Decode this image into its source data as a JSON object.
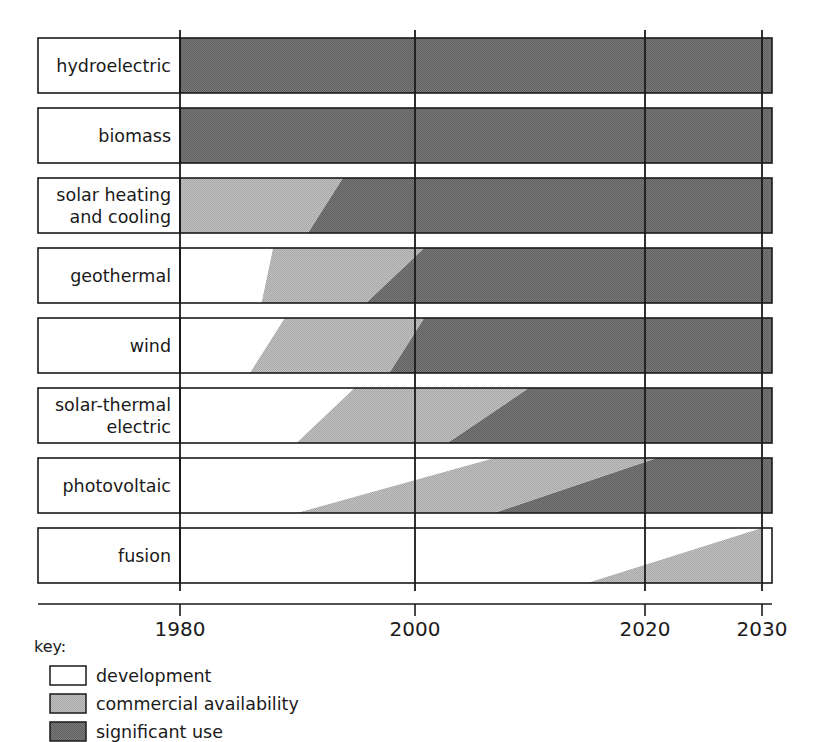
{
  "chart_data": {
    "type": "bar",
    "title": "",
    "subtitle": "",
    "xlabel": "",
    "ylabel": "",
    "xlim": [
      1975,
      2030
    ],
    "grid": true,
    "legend_position": "bottom-left",
    "x_ticks": [
      1980,
      2000,
      2020,
      2030
    ],
    "x_tick_labels": [
      "1980",
      "2000",
      "2020",
      "2030"
    ],
    "categories": [
      "hydroelectric",
      "biomass",
      "solar heating and cooling",
      "geothermal",
      "wind",
      "solar-thermal electric",
      "photovoltaic",
      "fusion"
    ],
    "stage_names": [
      "development",
      "commercial availability",
      "significant use"
    ],
    "stage_colors": {
      "development": "#ffffff",
      "commercial availability": "#b4b4b4",
      "significant use": "#6e6e6e"
    },
    "series": [
      {
        "name": "development",
        "note": "white segment ends at these years (top edge, bottom edge)",
        "values": [
          1980,
          1980,
          1975,
          1988,
          1989,
          1995,
          2007,
          2030
        ]
      },
      {
        "name": "commercial availability",
        "note": "light grey segment ends at these years (top edge, bottom edge)",
        "values": [
          1980,
          1980,
          1994,
          2000,
          2001,
          2010,
          2020,
          2030
        ]
      },
      {
        "name": "significant use",
        "note": "dark grey segment extends to 2030 where present",
        "values": [
          2030,
          2030,
          2030,
          2030,
          2030,
          2030,
          2030,
          null
        ]
      }
    ],
    "rows": [
      {
        "label": "hydroelectric",
        "label_lines": [
          "hydroelectric"
        ],
        "development_top": 1980,
        "development_bottom": 1980,
        "commercial_top": 1980,
        "commercial_bottom": 1980,
        "significant_end": 2030
      },
      {
        "label": "biomass",
        "label_lines": [
          "biomass"
        ],
        "development_top": 1980,
        "development_bottom": 1980,
        "commercial_top": 1980,
        "commercial_bottom": 1980,
        "significant_end": 2030
      },
      {
        "label": "solar heating and cooling",
        "label_lines": [
          "solar heating",
          "and cooling"
        ],
        "development_top": 1980,
        "development_bottom": 1980,
        "commercial_top": 1994,
        "commercial_bottom": 1991,
        "significant_end": 2030
      },
      {
        "label": "geothermal",
        "label_lines": [
          "geothermal"
        ],
        "development_top": 1988,
        "development_bottom": 1987,
        "commercial_top": 2001,
        "commercial_bottom": 1996,
        "significant_end": 2030
      },
      {
        "label": "wind",
        "label_lines": [
          "wind"
        ],
        "development_top": 1989,
        "development_bottom": 1986,
        "commercial_top": 2001,
        "commercial_bottom": 1998,
        "significant_end": 2030
      },
      {
        "label": "solar-thermal electric",
        "label_lines": [
          "solar-thermal",
          "electric"
        ],
        "development_top": 1995,
        "development_bottom": 1990,
        "commercial_top": 2010,
        "commercial_bottom": 2003,
        "significant_end": 2030
      },
      {
        "label": "photovoltaic",
        "label_lines": [
          "photovoltaic"
        ],
        "development_top": 2007,
        "development_bottom": 1990,
        "commercial_top": 2021,
        "commercial_bottom": 2007,
        "significant_end": 2030
      },
      {
        "label": "fusion",
        "label_lines": [
          "fusion"
        ],
        "development_top": 2030,
        "development_bottom": 2015,
        "commercial_top": 2030,
        "commercial_bottom": 2030,
        "significant_end": null
      }
    ]
  },
  "legend": {
    "title": "key:",
    "items": [
      {
        "label": "development",
        "color": "#ffffff"
      },
      {
        "label": "commercial availability",
        "color": "#b4b4b4"
      },
      {
        "label": "significant use",
        "color": "#6e6e6e"
      }
    ]
  },
  "axis": {
    "ticks": [
      {
        "label": "1980",
        "x": 180
      },
      {
        "label": "2000",
        "x": 415
      },
      {
        "label": "2020",
        "x": 645
      },
      {
        "label": "2030",
        "x": 762
      }
    ]
  }
}
